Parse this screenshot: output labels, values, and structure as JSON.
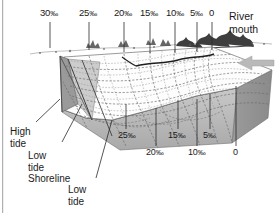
{
  "figure": {
    "title_visible": false,
    "type": "estuary-salinity-block-diagram",
    "colors": {
      "ink": "#1a1a1a",
      "water_surface": "#ffffff",
      "block_side_dark": "#8d8d8d",
      "block_side_mid": "#a8a8a8",
      "block_front": "#bdbdbd",
      "shore_wedge": "#9a9a9a",
      "contour": "#5a5a5a",
      "arrow": "#b5b5b5",
      "edge_rule": "#b0b0b0"
    }
  },
  "top_labels": [
    {
      "id": "top-30",
      "text": "30",
      "unit": "‰",
      "x": 40,
      "y": 8,
      "tick_x": 50,
      "tick_y0": 22,
      "tick_y1": 48
    },
    {
      "id": "top-25",
      "text": "25",
      "unit": "‰",
      "x": 79,
      "y": 8,
      "tick_x": 89,
      "tick_y0": 22,
      "tick_y1": 50
    },
    {
      "id": "top-20",
      "text": "20",
      "unit": "‰",
      "x": 114,
      "y": 8,
      "tick_x": 124,
      "tick_y0": 22,
      "tick_y1": 52
    },
    {
      "id": "top-15",
      "text": "15",
      "unit": "‰",
      "x": 140,
      "y": 8,
      "tick_x": 150,
      "tick_y0": 22,
      "tick_y1": 53
    },
    {
      "id": "top-10",
      "text": "10",
      "unit": "‰",
      "x": 166,
      "y": 8,
      "tick_x": 175,
      "tick_y0": 22,
      "tick_y1": 53
    },
    {
      "id": "top-5",
      "text": "5",
      "unit": "‰",
      "x": 190,
      "y": 8,
      "tick_x": 197,
      "tick_y0": 22,
      "tick_y1": 52
    },
    {
      "id": "top-0",
      "text": "0",
      "unit": "",
      "x": 209,
      "y": 8,
      "tick_x": 212,
      "tick_y0": 22,
      "tick_y1": 50
    }
  ],
  "bottom_labels": [
    {
      "id": "bot-25",
      "text": "25",
      "unit": "‰",
      "x": 118,
      "y": 131,
      "tick_x": 126,
      "tick_y0": 104,
      "tick_y1": 129
    },
    {
      "id": "bot-20",
      "text": "20",
      "unit": "‰",
      "x": 146,
      "y": 148,
      "tick_x": 156,
      "tick_y0": 108,
      "tick_y1": 146
    },
    {
      "id": "bot-15",
      "text": "15",
      "unit": "‰",
      "x": 168,
      "y": 131,
      "tick_x": 178,
      "tick_y0": 100,
      "tick_y1": 129
    },
    {
      "id": "bot-10",
      "text": "10",
      "unit": "‰",
      "x": 188,
      "y": 148,
      "tick_x": 197,
      "tick_y0": 99,
      "tick_y1": 146
    },
    {
      "id": "bot-5",
      "text": "5",
      "unit": "‰",
      "x": 203,
      "y": 131,
      "tick_x": 210,
      "tick_y0": 94,
      "tick_y1": 129
    },
    {
      "id": "bot-0",
      "text": "0",
      "unit": "",
      "x": 233,
      "y": 148,
      "tick_x": 236,
      "tick_y0": 86,
      "tick_y1": 146
    }
  ],
  "annotations": {
    "river_mouth": {
      "line1": "River",
      "line2": "mouth",
      "x": 229,
      "y": 10
    },
    "high_tide": {
      "line1": "High",
      "line2": "tide",
      "x": 10,
      "y": 126
    },
    "low_tide_shoreline": {
      "line1": "Low",
      "line2": "tide",
      "line3": "Shoreline",
      "x": 28,
      "y": 150
    },
    "low_tide_2": {
      "line1": "Low",
      "line2": "tide",
      "x": 68,
      "y": 184
    }
  },
  "chart_data": {
    "type": "diagram",
    "unit": "‰",
    "surface_isohalines": [
      30,
      25,
      20,
      15,
      10,
      5,
      0
    ],
    "bed_isohalines": [
      25,
      20,
      15,
      10,
      5,
      0
    ],
    "xlabel": "",
    "ylabel": "",
    "legend": []
  }
}
